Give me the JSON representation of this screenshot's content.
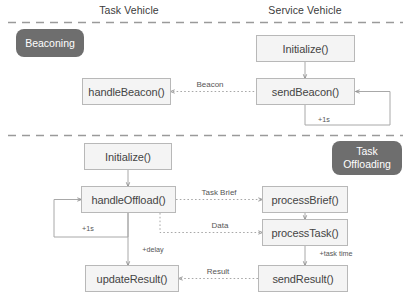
{
  "diagram": {
    "columns": [
      {
        "id": "task-vehicle",
        "label": "Task Vehicle"
      },
      {
        "id": "service-vehicle",
        "label": "Service Vehicle"
      }
    ],
    "sections": [
      {
        "id": "beaconing",
        "badge": [
          "Beaconing"
        ]
      },
      {
        "id": "task-offloading",
        "badge": [
          "Task",
          "Offloading"
        ]
      }
    ],
    "nodes": [
      {
        "id": "sv-initialize",
        "label": "Initialize()",
        "section": "beaconing",
        "column": "service-vehicle"
      },
      {
        "id": "send-beacon",
        "label": "sendBeacon()",
        "section": "beaconing",
        "column": "service-vehicle"
      },
      {
        "id": "handle-beacon",
        "label": "handleBeacon()",
        "section": "beaconing",
        "column": "task-vehicle"
      },
      {
        "id": "tv-initialize",
        "label": "Initialize()",
        "section": "task-offloading",
        "column": "task-vehicle"
      },
      {
        "id": "handle-offload",
        "label": "handleOffload()",
        "section": "task-offloading",
        "column": "task-vehicle"
      },
      {
        "id": "update-result",
        "label": "updateResult()",
        "section": "task-offloading",
        "column": "task-vehicle"
      },
      {
        "id": "process-brief",
        "label": "processBrief()",
        "section": "task-offloading",
        "column": "service-vehicle"
      },
      {
        "id": "process-task",
        "label": "processTask()",
        "section": "task-offloading",
        "column": "service-vehicle"
      },
      {
        "id": "send-result",
        "label": "sendResult()",
        "section": "task-offloading",
        "column": "service-vehicle"
      }
    ],
    "edges": [
      {
        "id": "init-to-sendbeacon",
        "from": "sv-initialize",
        "to": "send-beacon",
        "label": "",
        "style": "solid"
      },
      {
        "id": "sendbeacon-to-handlebeacon",
        "from": "send-beacon",
        "to": "handle-beacon",
        "label": "Beacon",
        "style": "dotted"
      },
      {
        "id": "sendbeacon-loop",
        "from": "send-beacon",
        "to": "send-beacon",
        "label": "+1s",
        "style": "solid"
      },
      {
        "id": "init-to-handleoffload",
        "from": "tv-initialize",
        "to": "handle-offload",
        "label": "",
        "style": "solid"
      },
      {
        "id": "handleoffload-loop",
        "from": "handle-offload",
        "to": "handle-offload",
        "label": "+1s",
        "style": "solid"
      },
      {
        "id": "handleoffload-to-brief",
        "from": "handle-offload",
        "to": "process-brief",
        "label": "Task Brief",
        "style": "dotted"
      },
      {
        "id": "handleoffload-to-task",
        "from": "handle-offload",
        "to": "process-task",
        "label": "Data",
        "style": "dotted"
      },
      {
        "id": "brief-to-task",
        "from": "process-brief",
        "to": "process-task",
        "label": "",
        "style": "solid"
      },
      {
        "id": "task-to-sendresult",
        "from": "process-task",
        "to": "send-result",
        "label": "+task time",
        "style": "solid"
      },
      {
        "id": "handleoffload-to-update",
        "from": "handle-offload",
        "to": "update-result",
        "label": "+delay",
        "style": "solid"
      },
      {
        "id": "sendresult-to-update",
        "from": "send-result",
        "to": "update-result",
        "label": "Result",
        "style": "dotted"
      }
    ],
    "dividers": [
      {
        "id": "divider-top"
      },
      {
        "id": "divider-middle"
      }
    ],
    "colors": {
      "badge_background": "#6e6e6e",
      "badge_text": "#ffffff",
      "node_background": "#f4f4f4",
      "node_border": "#b8b8b8",
      "node_text": "#444444",
      "line": "#a8a8a8",
      "divider": "#9a9a9a",
      "header_text": "#3b3b3b",
      "edge_label_text": "#555555"
    }
  }
}
